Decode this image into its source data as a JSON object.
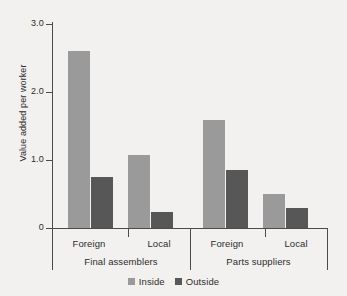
{
  "chart_data": {
    "type": "bar",
    "title": "",
    "subtitle": "",
    "xlabel": "",
    "ylabel": "Value added per worker",
    "ylim": [
      0,
      3.0
    ],
    "yticks": [
      "0",
      "1.0",
      "2.0",
      "3.0"
    ],
    "ytick_values": [
      0,
      1.0,
      2.0,
      3.0
    ],
    "grid": false,
    "legend_position": "bottom",
    "categories": [
      "Foreign",
      "Local",
      "Foreign",
      "Local"
    ],
    "supercategories": [
      "Final assemblers",
      "Parts suppliers"
    ],
    "series": [
      {
        "name": "Inside",
        "color": "#9a9a9a",
        "values": [
          2.6,
          1.07,
          1.59,
          0.5
        ]
      },
      {
        "name": "Outside",
        "color": "#575757",
        "values": [
          0.75,
          0.24,
          0.85,
          0.29
        ]
      }
    ],
    "groups": [
      {
        "supercategory": "Final assemblers",
        "category": "Foreign",
        "inside": 2.6,
        "outside": 0.75
      },
      {
        "supercategory": "Final assemblers",
        "category": "Local",
        "inside": 1.07,
        "outside": 0.24
      },
      {
        "supercategory": "Parts suppliers",
        "category": "Foreign",
        "inside": 1.59,
        "outside": 0.85
      },
      {
        "supercategory": "Parts suppliers",
        "category": "Local",
        "inside": 0.5,
        "outside": 0.29
      }
    ]
  },
  "axis": {
    "y_title": "Value added per worker",
    "ticks": [
      {
        "label": "3.0",
        "value": 3.0
      },
      {
        "label": "2.0",
        "value": 2.0
      },
      {
        "label": "1.0",
        "value": 1.0
      },
      {
        "label": "0",
        "value": 0.0
      }
    ]
  },
  "xaxis": {
    "tick_labels": [
      {
        "label": "Foreign"
      },
      {
        "label": "Local"
      },
      {
        "label": "Foreign"
      },
      {
        "label": "Local"
      }
    ],
    "group_labels": [
      {
        "label": "Final assemblers"
      },
      {
        "label": "Parts suppliers"
      }
    ]
  },
  "legend": {
    "entries": [
      {
        "label": "Inside",
        "color": "#9a9a9a",
        "icon": "square-swatch-icon"
      },
      {
        "label": "Outside",
        "color": "#575757",
        "icon": "square-swatch-icon"
      }
    ]
  }
}
